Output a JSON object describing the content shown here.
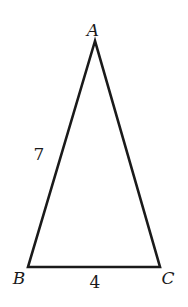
{
  "diagram": {
    "type": "triangle",
    "stroke_color": "#1a1a1a",
    "vertices": [
      {
        "name": "A",
        "x": 95,
        "y": 41,
        "label_x": 93,
        "label_y": 36
      },
      {
        "name": "B",
        "x": 28,
        "y": 267,
        "label_x": 19,
        "label_y": 284
      },
      {
        "name": "C",
        "x": 160,
        "y": 267,
        "label_x": 168,
        "label_y": 284
      }
    ],
    "sides": [
      {
        "between": "AB",
        "length_label": "7",
        "label_x": 39,
        "label_y": 160
      },
      {
        "between": "BC",
        "length_label": "4",
        "label_x": 95,
        "label_y": 288
      }
    ]
  }
}
